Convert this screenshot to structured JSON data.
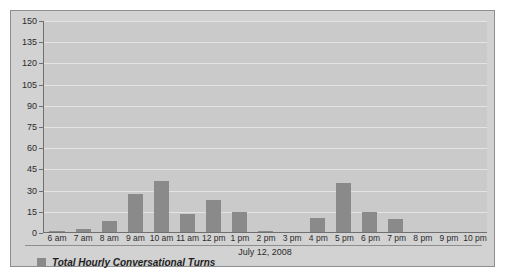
{
  "chart_data": {
    "type": "bar",
    "title": "",
    "xlabel": "July 12, 2008",
    "ylabel": "",
    "categories": [
      "6 am",
      "7 am",
      "8 am",
      "9 am",
      "10 am",
      "11 am",
      "12 pm",
      "1 pm",
      "2 pm",
      "3 pm",
      "4 pm",
      "5 pm",
      "6 pm",
      "7 pm",
      "8 pm",
      "9 pm",
      "10 pm"
    ],
    "values": [
      0.5,
      2,
      8,
      27,
      36,
      13,
      23,
      14,
      1,
      0,
      10,
      35,
      14,
      9,
      0,
      0,
      0
    ],
    "series": [
      {
        "name": "Total Hourly Conversational Turns",
        "values": [
          0.5,
          2,
          8,
          27,
          36,
          13,
          23,
          14,
          1,
          0,
          10,
          35,
          14,
          9,
          0,
          0,
          0
        ]
      }
    ],
    "ylim": [
      0,
      150
    ],
    "ytick_interval": 15,
    "yticks": [
      0,
      15,
      30,
      45,
      60,
      75,
      90,
      105,
      120,
      135,
      150
    ],
    "grid": true,
    "legend_position": "bottom-left",
    "legend": [
      "Total Hourly Conversational Turns"
    ],
    "colors": {
      "bar": "#8a8a8a",
      "plot_background": "#cacaca",
      "frame_background": "#d2d2d2",
      "gridline": "#e4e4e4",
      "axis": "#6f6f6f",
      "text": "#2b2b2b"
    }
  },
  "legend": {
    "swatch_color": "#8a8a8a",
    "label": "Total Hourly Conversational Turns"
  }
}
